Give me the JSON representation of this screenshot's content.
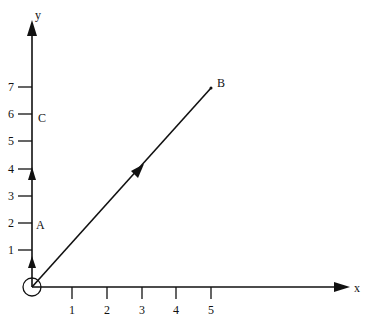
{
  "axes": {
    "x_label": "x",
    "y_label": "y",
    "x_ticks": [
      "1",
      "2",
      "3",
      "4",
      "5"
    ],
    "y_ticks": [
      "1",
      "2",
      "3",
      "4",
      "5",
      "6",
      "7"
    ]
  },
  "points": {
    "A": {
      "label": "A",
      "x": 0,
      "y": 2
    },
    "B": {
      "label": "B",
      "x": 5,
      "y": 7
    },
    "C": {
      "label": "C",
      "x": 0,
      "y": 6
    },
    "O": {
      "label": "",
      "x": 0,
      "y": 0
    }
  },
  "colors": {
    "ink": "#111111",
    "background": "#ffffff"
  }
}
